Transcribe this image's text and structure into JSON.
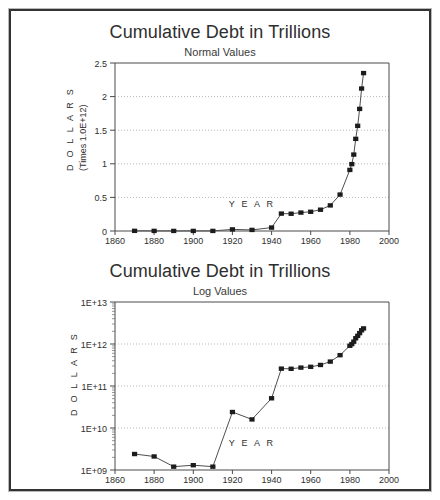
{
  "page": {
    "background": "#ffffff",
    "frame_color": "#333333"
  },
  "charts": [
    {
      "id": "normal",
      "title": "Cumulative Debt in Trillions",
      "subtitle": "Normal Values",
      "xlabel": "Y E A R",
      "ylabel_main": "D O L L A R S",
      "ylabel_sub": "(Times 1.0E+12)",
      "x_ticks": [
        "1860",
        "1880",
        "1900",
        "1920",
        "1940",
        "1960",
        "1980",
        "2000"
      ],
      "y_ticks": [
        "0",
        "0.5",
        "1",
        "1.5",
        "2",
        "2.5"
      ]
    },
    {
      "id": "log",
      "title": "Cumulative Debt in Trillions",
      "subtitle": "Log Values",
      "xlabel": "Y E A R",
      "ylabel_main": "D O L L A R S",
      "ylabel_sub": "",
      "x_ticks": [
        "1860",
        "1880",
        "1900",
        "1920",
        "1940",
        "1960",
        "1980",
        "2000"
      ],
      "y_ticks": [
        "1E+09",
        "1E+10",
        "1E+11",
        "1E+12",
        "1E+13"
      ]
    }
  ],
  "chart_data": [
    {
      "type": "line",
      "title": "Cumulative Debt in Trillions",
      "subtitle": "Normal Values",
      "xlabel": "Y E A R",
      "ylabel": "D O L L A R S (Times 1.0E+12)",
      "xlim": [
        1860,
        2000
      ],
      "ylim": [
        0,
        2.5
      ],
      "xticks": [
        1860,
        1880,
        1900,
        1920,
        1940,
        1960,
        1980,
        2000
      ],
      "yticks": [
        0,
        0.5,
        1,
        1.5,
        2,
        2.5
      ],
      "grid": true,
      "legend": "none",
      "marker": "filled-square",
      "x": [
        1870,
        1880,
        1890,
        1900,
        1910,
        1920,
        1930,
        1940,
        1945,
        1950,
        1955,
        1960,
        1965,
        1970,
        1975,
        1980,
        1981,
        1982,
        1983,
        1984,
        1985,
        1986,
        1987
      ],
      "y": [
        0.0024,
        0.0021,
        0.0012,
        0.0013,
        0.0012,
        0.024,
        0.016,
        0.051,
        0.259,
        0.257,
        0.274,
        0.286,
        0.317,
        0.381,
        0.542,
        0.909,
        0.995,
        1.137,
        1.371,
        1.565,
        1.817,
        2.12,
        2.35
      ]
    },
    {
      "type": "line",
      "title": "Cumulative Debt in Trillions",
      "subtitle": "Log Values",
      "xlabel": "Y E A R",
      "ylabel": "D O L L A R S",
      "xlim": [
        1860,
        2000
      ],
      "ylim": [
        1000000000,
        10000000000000
      ],
      "yscale": "log",
      "xticks": [
        1860,
        1880,
        1900,
        1920,
        1940,
        1960,
        1980,
        2000
      ],
      "yticks": [
        1000000000,
        10000000000,
        100000000000,
        1000000000000,
        10000000000000
      ],
      "ytick_labels": [
        "1E+09",
        "1E+10",
        "1E+11",
        "1E+12",
        "1E+13"
      ],
      "grid": true,
      "legend": "none",
      "marker": "filled-square",
      "x": [
        1870,
        1880,
        1890,
        1900,
        1910,
        1920,
        1930,
        1940,
        1945,
        1950,
        1955,
        1960,
        1965,
        1970,
        1975,
        1980,
        1981,
        1982,
        1983,
        1984,
        1985,
        1986,
        1987
      ],
      "y": [
        2400000000,
        2100000000,
        1200000000,
        1300000000,
        1200000000,
        24000000000,
        16000000000,
        51000000000,
        259000000000,
        257000000000,
        274000000000,
        286000000000,
        317000000000,
        381000000000,
        542000000000,
        909000000000,
        995000000000,
        1137000000000,
        1371000000000,
        1565000000000,
        1817000000000,
        2120000000000,
        2350000000000
      ]
    }
  ]
}
